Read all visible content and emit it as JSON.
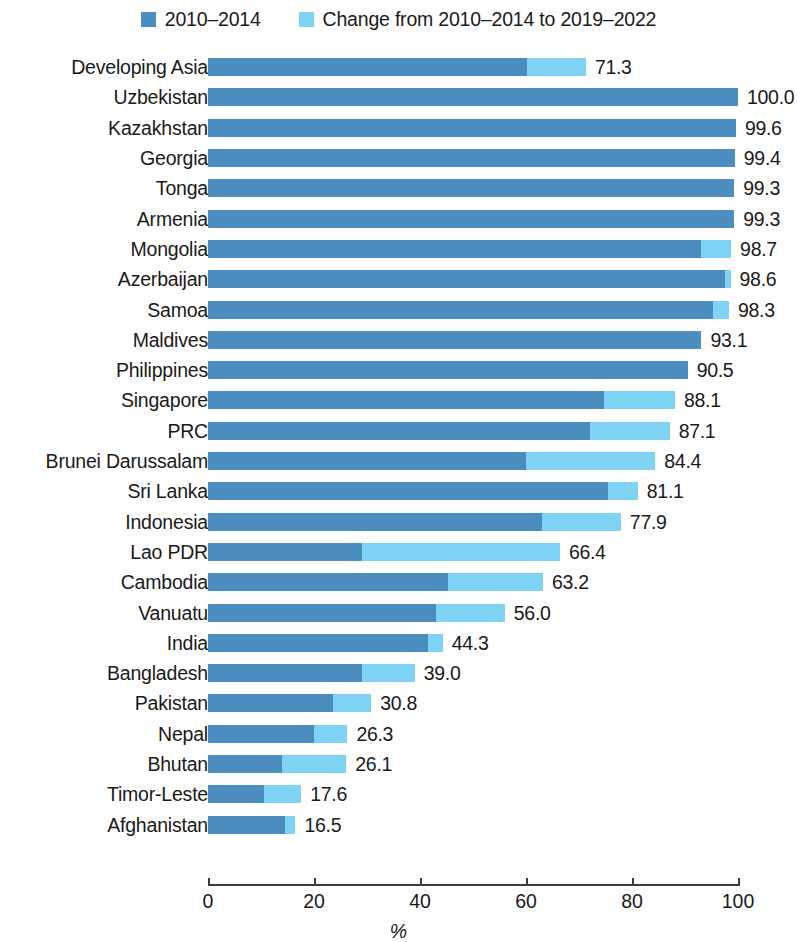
{
  "legend": {
    "entries": [
      {
        "label": "2010–2014",
        "color": "#4C8DBF",
        "icon": "square-swatch-icon"
      },
      {
        "label": "Change from 2010–2014 to 2019–2022",
        "color": "#7FD4F5",
        "icon": "square-swatch-icon"
      }
    ]
  },
  "axis": {
    "title": "%",
    "ticks": [
      "0",
      "20",
      "40",
      "60",
      "80",
      "100"
    ]
  },
  "chart_data": {
    "type": "bar",
    "orientation": "horizontal",
    "stacked": true,
    "title": "",
    "subtitle": "",
    "xlabel": "%",
    "ylabel": "",
    "xlim": [
      0,
      100
    ],
    "xticks": [
      0,
      20,
      40,
      60,
      80,
      100
    ],
    "grid": false,
    "legend_position": "top-center",
    "categories": [
      "Developing Asia",
      "Uzbekistan",
      "Kazakhstan",
      "Georgia",
      "Tonga",
      "Armenia",
      "Mongolia",
      "Azerbaijan",
      "Samoa",
      "Maldives",
      "Philippines",
      "Singapore",
      "PRC",
      "Brunei Darussalam",
      "Sri Lanka",
      "Indonesia",
      "Lao PDR",
      "Cambodia",
      "Vanuatu",
      "India",
      "Bangladesh",
      "Pakistan",
      "Nepal",
      "Bhutan",
      "Timor-Leste",
      "Afghanistan"
    ],
    "series": [
      {
        "name": "2010–2014",
        "color": "#4C8DBF",
        "values": [
          60.2,
          100.0,
          99.6,
          99.4,
          99.3,
          99.3,
          93.0,
          97.5,
          95.3,
          93.1,
          90.5,
          74.7,
          72.0,
          60.0,
          75.5,
          63.0,
          29.0,
          45.2,
          43.0,
          41.5,
          29.0,
          23.5,
          20.0,
          14.0,
          10.5,
          14.5
        ]
      },
      {
        "name": "Change from 2010–2014 to 2019–2022",
        "color": "#7FD4F5",
        "values": [
          11.1,
          0.0,
          0.0,
          0.0,
          0.0,
          0.0,
          5.7,
          1.1,
          3.0,
          0.0,
          0.0,
          13.4,
          15.1,
          24.4,
          5.6,
          14.9,
          37.4,
          18.0,
          13.0,
          2.8,
          10.0,
          7.3,
          6.3,
          12.1,
          7.1,
          2.0
        ]
      }
    ],
    "totals": [
      71.3,
      100.0,
      99.6,
      99.4,
      99.3,
      99.3,
      98.7,
      98.6,
      98.3,
      93.1,
      90.5,
      88.1,
      87.1,
      84.4,
      81.1,
      77.9,
      66.4,
      63.2,
      56.0,
      44.3,
      39.0,
      30.8,
      26.3,
      26.1,
      17.6,
      16.5
    ],
    "value_labels": [
      "71.3",
      "100.0",
      "99.6",
      "99.4",
      "99.3",
      "99.3",
      "98.7",
      "98.6",
      "98.3",
      "93.1",
      "90.5",
      "88.1",
      "87.1",
      "84.4",
      "81.1",
      "77.9",
      "66.4",
      "63.2",
      "56.0",
      "44.3",
      "39.0",
      "30.8",
      "26.3",
      "26.1",
      "17.6",
      "16.5"
    ]
  }
}
